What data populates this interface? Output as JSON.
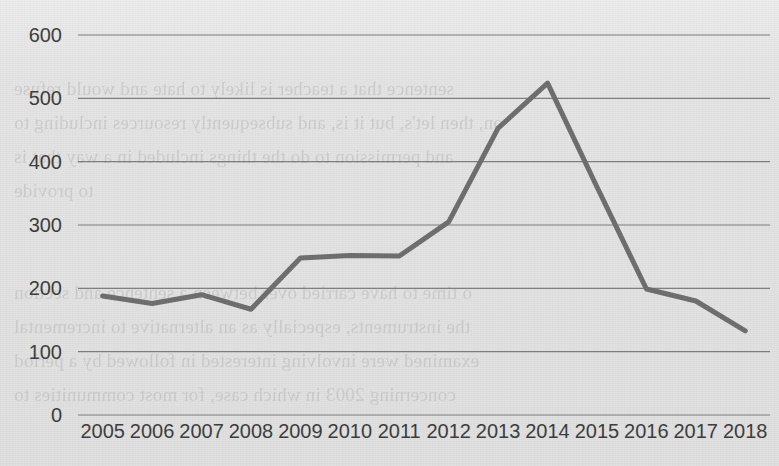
{
  "chart_data": {
    "type": "line",
    "title": "",
    "xlabel": "",
    "ylabel": "",
    "categories": [
      "2005",
      "2006",
      "2007",
      "2008",
      "2009",
      "2010",
      "2011",
      "2012",
      "2013",
      "2014",
      "2015",
      "2016",
      "2017",
      "2018"
    ],
    "values": [
      188,
      176,
      190,
      167,
      248,
      252,
      251,
      305,
      453,
      524,
      360,
      199,
      180,
      133
    ],
    "series": [
      {
        "name": "",
        "values": [
          188,
          176,
          190,
          167,
          248,
          252,
          251,
          305,
          453,
          524,
          360,
          199,
          180,
          133
        ]
      }
    ],
    "ylim": [
      0,
      600
    ],
    "yticks": [
      0,
      100,
      200,
      300,
      400,
      500,
      600
    ],
    "ytick_labels": [
      "0",
      "100",
      "200",
      "300",
      "400",
      "500",
      "600"
    ],
    "grid": "horizontal-only",
    "legend": "none",
    "line_color": "#6d6d6d",
    "grid_color": "#7d7d7d",
    "text_color": "#3b3b3b",
    "background_color": "#e4e4e4",
    "markers": "none",
    "line_width": 5
  },
  "page": {
    "ghost_text": [
      "sentence that a teacher is likely to hate and would refuse",
      "on, then let's, but it is, and subsequently resources including to",
      "and permission to do the things included in a way that is",
      "to provide",
      "o time to have carried over between a sentence and section",
      "the instruments, especially as an alternative to incremental",
      "examined were involving interested in followed by a period",
      "concerning 2003 in which case, for most communities to"
    ]
  }
}
